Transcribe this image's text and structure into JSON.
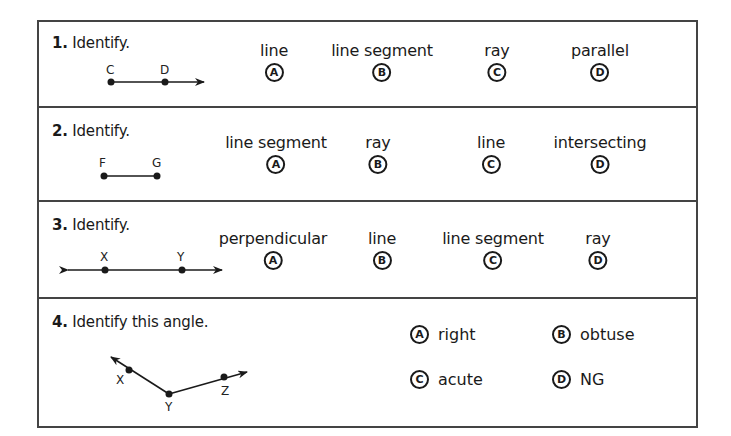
{
  "questions": [
    {
      "number": "1.",
      "prompt": "Identify.",
      "figure": {
        "type": "ray",
        "points": [
          "C",
          "D"
        ]
      },
      "choices": [
        {
          "letter": "A",
          "text": "line"
        },
        {
          "letter": "B",
          "text": "line segment"
        },
        {
          "letter": "C",
          "text": "ray"
        },
        {
          "letter": "D",
          "text": "parallel"
        }
      ]
    },
    {
      "number": "2.",
      "prompt": "Identify.",
      "figure": {
        "type": "line segment",
        "points": [
          "F",
          "G"
        ]
      },
      "choices": [
        {
          "letter": "A",
          "text": "line segment"
        },
        {
          "letter": "B",
          "text": "ray"
        },
        {
          "letter": "C",
          "text": "line"
        },
        {
          "letter": "D",
          "text": "intersecting"
        }
      ]
    },
    {
      "number": "3.",
      "prompt": "Identify.",
      "figure": {
        "type": "line",
        "points": [
          "X",
          "Y"
        ]
      },
      "choices": [
        {
          "letter": "A",
          "text": "perpendicular"
        },
        {
          "letter": "B",
          "text": "line"
        },
        {
          "letter": "C",
          "text": "line segment"
        },
        {
          "letter": "D",
          "text": "ray"
        }
      ]
    },
    {
      "number": "4.",
      "prompt": "Identify this angle.",
      "figure": {
        "type": "angle",
        "points": [
          "X",
          "Y",
          "Z"
        ]
      },
      "choices": [
        {
          "letter": "A",
          "text": "right"
        },
        {
          "letter": "B",
          "text": "obtuse"
        },
        {
          "letter": "C",
          "text": "acute"
        },
        {
          "letter": "D",
          "text": "NG"
        }
      ]
    }
  ]
}
